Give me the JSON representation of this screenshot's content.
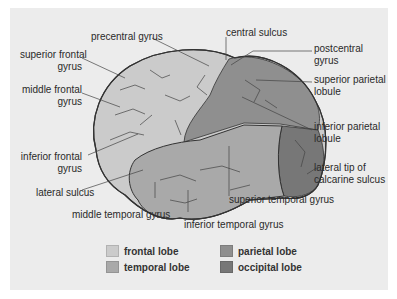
{
  "figure": {
    "labels": {
      "precentral_gyrus": "precentral gyrus",
      "superior_frontal_gyrus": [
        "superior frontal",
        "gyrus"
      ],
      "middle_frontal_gyrus": [
        "middle frontal",
        "gyrus"
      ],
      "inferior_frontal_gyrus": [
        "inferior frontal",
        "gyrus"
      ],
      "lateral_sulcus": "lateral sulcus",
      "middle_temporal_gyrus": "middle temporal gyrus",
      "inferior_temporal_gyrus": "inferior temporal gyrus",
      "superior_temporal_gyrus": "superior temporal gyrus",
      "central_sulcus": "central sulcus",
      "postcentral_gyrus": [
        "postcentral",
        "gyrus"
      ],
      "superior_parietal_lobule": [
        "superior parietal",
        "lobule"
      ],
      "inferior_parietal_lobule": [
        "inferior parietal",
        "lobule"
      ],
      "lateral_tip_calcarine": [
        "lateral tip of",
        "calcarine sulcus"
      ]
    }
  },
  "legend": [
    {
      "label": "frontal lobe",
      "color": "#cbcbcb"
    },
    {
      "label": "temporal lobe",
      "color": "#a9a9a9"
    },
    {
      "label": "parietal lobe",
      "color": "#8f8f8f"
    },
    {
      "label": "occipital lobe",
      "color": "#777777"
    }
  ],
  "colors": {
    "background": "#ececec",
    "outline": "#333333"
  }
}
